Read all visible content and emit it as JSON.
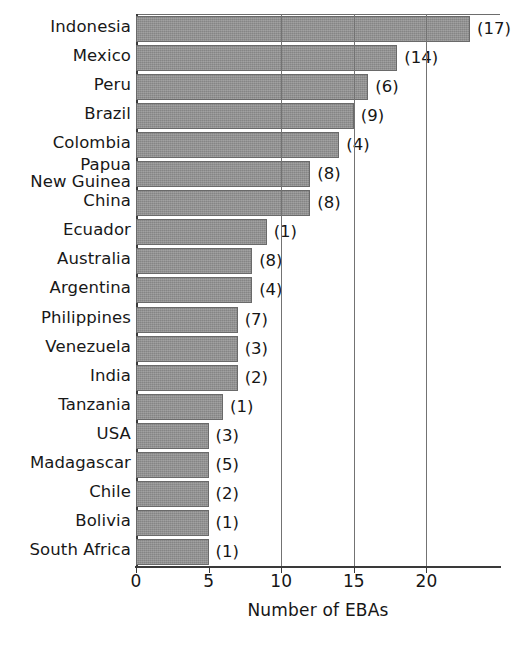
{
  "chart_data": {
    "type": "bar",
    "orientation": "horizontal",
    "title": "",
    "xlabel": "Number of EBAs",
    "ylabel": "",
    "xlim": [
      0,
      25
    ],
    "xticks": [
      0,
      5,
      10,
      15,
      20
    ],
    "gridlines": [
      10,
      15,
      20
    ],
    "grid": true,
    "legend": null,
    "bar_color": "#8e8e8e",
    "categories": [
      "Indonesia",
      "Mexico",
      "Peru",
      "Brazil",
      "Colombia",
      "Papua\nNew Guinea",
      "China",
      "Ecuador",
      "Australia",
      "Argentina",
      "Philippines",
      "Venezuela",
      "India",
      "Tanzania",
      "USA",
      "Madagascar",
      "Chile",
      "Bolivia",
      "South Africa"
    ],
    "values": [
      23,
      18,
      16,
      15,
      14,
      12,
      12,
      9,
      8,
      8,
      7,
      7,
      7,
      6,
      5,
      5,
      5,
      5,
      5
    ],
    "annotations": [
      "(17)",
      "(14)",
      "(6)",
      "(9)",
      "(4)",
      "(8)",
      "(8)",
      "(1)",
      "(8)",
      "(4)",
      "(7)",
      "(3)",
      "(2)",
      "(1)",
      "(3)",
      "(5)",
      "(2)",
      "(1)",
      "(1)"
    ],
    "annotation_note": "Value in parentheses after each bar"
  }
}
